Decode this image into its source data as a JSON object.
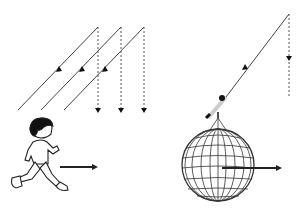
{
  "diagram": {
    "title": "",
    "panels": [
      {
        "name": "rain-analogy",
        "description": "Running person sees rain falling at a slant",
        "elements": [
          "slanted-rain-lines",
          "vertical-dotted-rain-lines",
          "running-boy",
          "motion-arrow"
        ]
      },
      {
        "name": "aberration-of-starlight",
        "description": "Telescope on moving Earth tilted toward apparent starlight direction",
        "elements": [
          "slanted-light-ray",
          "vertical-dotted-true-ray",
          "telescope",
          "earth-globe",
          "motion-arrow"
        ]
      }
    ],
    "colors": {
      "line": "#333333",
      "background": "#ffffff"
    }
  }
}
